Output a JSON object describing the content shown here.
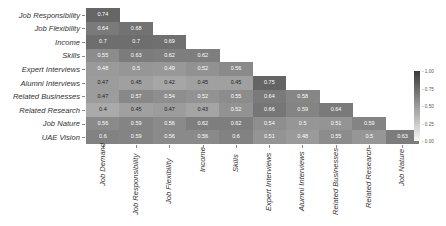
{
  "chart_data": {
    "type": "heatmap",
    "title": "",
    "xlabel": "",
    "ylabel": "",
    "row_labels": [
      "Job Responsibility",
      "Job Flexibility",
      "Income",
      "Skills",
      "Expert Interviews",
      "Alumni Interviews",
      "Related Businesses",
      "Related Research",
      "Job Nature",
      "UAE Vision"
    ],
    "col_labels": [
      "Job Demand",
      "Job Responsibility",
      "Job Flexibility",
      "Income",
      "Skills",
      "Expert Interviews",
      "Alumni Interviews",
      "Related Businesses",
      "Related Research",
      "Job Nature"
    ],
    "values": [
      [
        0.74
      ],
      [
        0.64,
        0.68
      ],
      [
        0.7,
        0.7,
        0.69
      ],
      [
        0.55,
        0.63,
        0.62,
        0.62
      ],
      [
        0.48,
        0.5,
        0.49,
        0.52,
        0.56
      ],
      [
        0.47,
        0.45,
        0.42,
        0.45,
        0.45,
        0.75
      ],
      [
        0.47,
        0.57,
        0.54,
        0.52,
        0.55,
        0.64,
        0.58
      ],
      [
        0.4,
        0.45,
        0.47,
        0.43,
        0.52,
        0.66,
        0.59,
        0.64
      ],
      [
        0.56,
        0.59,
        0.56,
        0.62,
        0.62,
        0.54,
        0.5,
        0.51,
        0.59
      ],
      [
        0.6,
        0.59,
        0.56,
        0.56,
        0.6,
        0.51,
        0.48,
        0.55,
        0.5,
        0.63
      ]
    ],
    "colorbar": {
      "ticks": [
        "1.00",
        "0.75",
        "0.50",
        "0.25",
        "0.00"
      ],
      "range": [
        0,
        1
      ],
      "colormap": "grayscale"
    }
  }
}
